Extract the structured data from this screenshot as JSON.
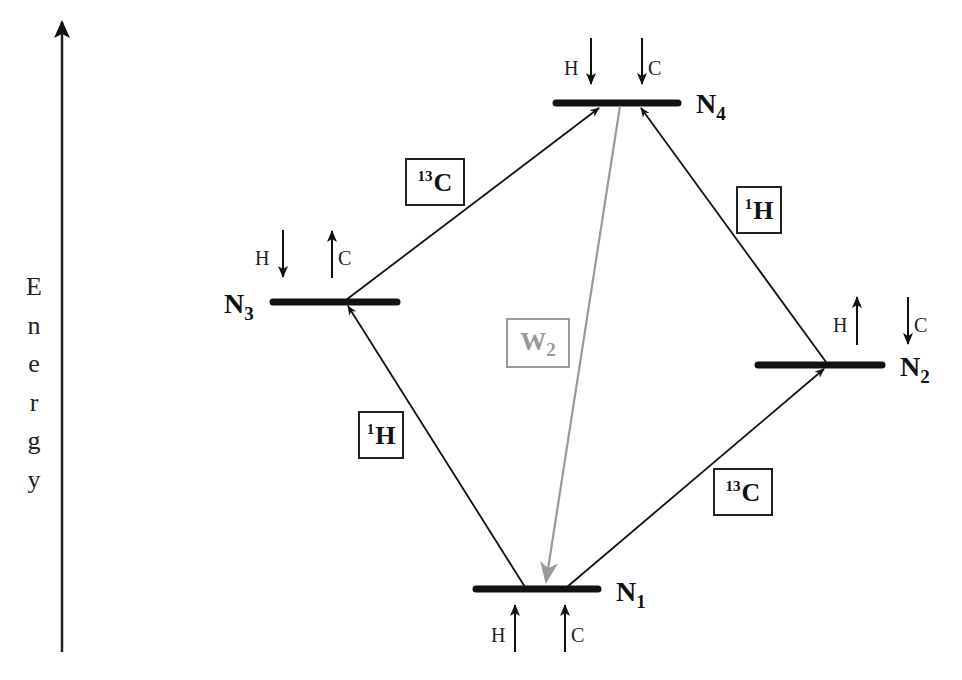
{
  "axis": {
    "label_letters": [
      "E",
      "n",
      "e",
      "r",
      "g",
      "y"
    ],
    "label": "Energy"
  },
  "levels": [
    {
      "id": "N1",
      "letter": "N",
      "sub": "1",
      "spins": {
        "H": "up",
        "C": "up"
      }
    },
    {
      "id": "N2",
      "letter": "N",
      "sub": "2",
      "spins": {
        "H": "up",
        "C": "down"
      }
    },
    {
      "id": "N3",
      "letter": "N",
      "sub": "3",
      "spins": {
        "H": "down",
        "C": "up"
      }
    },
    {
      "id": "N4",
      "letter": "N",
      "sub": "4",
      "spins": {
        "H": "down",
        "C": "down"
      }
    }
  ],
  "spin_labels": {
    "H": "H",
    "C": "C"
  },
  "transitions": [
    {
      "from": "N1",
      "to": "N3",
      "label_sup": "1",
      "label": "H",
      "color": "#111111"
    },
    {
      "from": "N1",
      "to": "N2",
      "label_sup": "13",
      "label": "C",
      "color": "#111111"
    },
    {
      "from": "N3",
      "to": "N4",
      "label_sup": "13",
      "label": "C",
      "color": "#111111"
    },
    {
      "from": "N2",
      "to": "N4",
      "label_sup": "1",
      "label": "H",
      "color": "#111111"
    },
    {
      "from": "N4",
      "to": "N1",
      "label": "W",
      "label_sub": "2",
      "color": "#999999"
    }
  ]
}
